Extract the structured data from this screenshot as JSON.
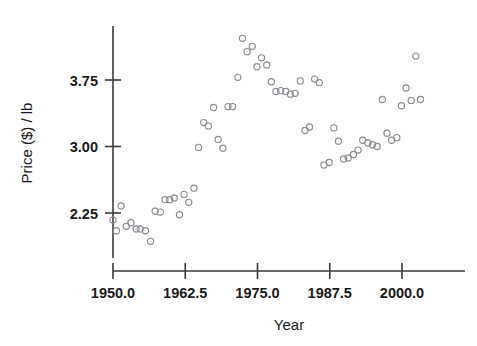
{
  "chart_data": {
    "type": "scatter",
    "title": "",
    "xlabel": "Year",
    "ylabel": "Price ($) / lb",
    "xlim": [
      1947.5,
      2006.0
    ],
    "ylim": [
      1.85,
      4.35
    ],
    "xticks": [
      "1950.0",
      "1962.5",
      "1975.0",
      "1987.5",
      "2000.0"
    ],
    "xtick_values": [
      1950.0,
      1962.5,
      1975.0,
      1987.5,
      2000.0
    ],
    "yticks": [
      "2.25",
      "3.00",
      "3.75"
    ],
    "ytick_values": [
      2.25,
      3.0,
      3.75
    ],
    "grid": false,
    "legend": null,
    "marker": "open-circle",
    "marker_color": "#8c8c92",
    "points": [
      [
        1950.0,
        2.17
      ],
      [
        1950.6,
        2.05
      ],
      [
        1951.4,
        2.33
      ],
      [
        1952.3,
        2.1
      ],
      [
        1953.1,
        2.14
      ],
      [
        1954.0,
        2.07
      ],
      [
        1954.7,
        2.07
      ],
      [
        1955.6,
        2.05
      ],
      [
        1956.5,
        1.93
      ],
      [
        1957.3,
        2.27
      ],
      [
        1958.2,
        2.26
      ],
      [
        1959.0,
        2.4
      ],
      [
        1959.8,
        2.4
      ],
      [
        1960.6,
        2.42
      ],
      [
        1961.5,
        2.23
      ],
      [
        1962.3,
        2.46
      ],
      [
        1963.1,
        2.37
      ],
      [
        1964.0,
        2.53
      ],
      [
        1964.8,
        2.99
      ],
      [
        1965.7,
        3.27
      ],
      [
        1966.5,
        3.23
      ],
      [
        1967.4,
        3.44
      ],
      [
        1968.2,
        3.08
      ],
      [
        1969.0,
        2.98
      ],
      [
        1969.9,
        3.45
      ],
      [
        1970.7,
        3.45
      ],
      [
        1971.6,
        3.78
      ],
      [
        1972.4,
        4.22
      ],
      [
        1973.2,
        4.07
      ],
      [
        1974.1,
        4.13
      ],
      [
        1974.9,
        3.9
      ],
      [
        1975.7,
        4.0
      ],
      [
        1976.6,
        3.92
      ],
      [
        1977.4,
        3.73
      ],
      [
        1978.2,
        3.62
      ],
      [
        1979.0,
        3.63
      ],
      [
        1979.9,
        3.62
      ],
      [
        1980.7,
        3.59
      ],
      [
        1981.5,
        3.6
      ],
      [
        1982.4,
        3.74
      ],
      [
        1983.2,
        3.18
      ],
      [
        1984.0,
        3.22
      ],
      [
        1984.9,
        3.76
      ],
      [
        1985.7,
        3.72
      ],
      [
        1986.5,
        2.79
      ],
      [
        1987.4,
        2.82
      ],
      [
        1988.2,
        3.21
      ],
      [
        1989.0,
        3.06
      ],
      [
        1989.9,
        2.86
      ],
      [
        1990.7,
        2.87
      ],
      [
        1991.6,
        2.91
      ],
      [
        1992.4,
        2.96
      ],
      [
        1993.2,
        3.07
      ],
      [
        1994.1,
        3.04
      ],
      [
        1994.9,
        3.02
      ],
      [
        1995.7,
        3.0
      ],
      [
        1996.6,
        3.53
      ],
      [
        1997.4,
        3.15
      ],
      [
        1998.2,
        3.07
      ],
      [
        1999.1,
        3.1
      ],
      [
        1999.9,
        3.46
      ],
      [
        2000.7,
        3.66
      ],
      [
        2001.6,
        3.52
      ],
      [
        2002.4,
        4.02
      ],
      [
        2003.2,
        3.53
      ]
    ]
  }
}
